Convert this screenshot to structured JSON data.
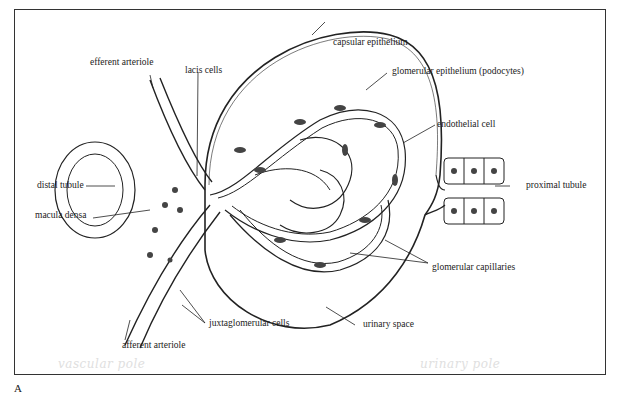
{
  "figure": {
    "panel_label": "A"
  },
  "labels": {
    "efferent_arteriole": "efferent arteriole",
    "lacis_cells": "lacis cells",
    "capsular_epithelium": "capsular epithelium",
    "glomerular_epithelium": "glomerular epithelium (podocytes)",
    "endothelial_cell": "endothelial cell",
    "distal_tubule": "distal tubule",
    "macula_densa": "macula densa",
    "proximal_tubule": "proximal tubule",
    "glomerular_capillaries": "glomerular capillaries",
    "juxtaglomerular_cells": "juxtaglomerular cells",
    "urinary_space": "urinary space",
    "afferent_arteriole": "afferent arteriole"
  },
  "annotations": {
    "vascular_pole": "vascular pole",
    "urinary_pole": "urinary pole"
  }
}
